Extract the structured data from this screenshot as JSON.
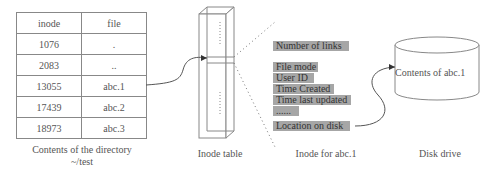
{
  "directory_table": {
    "headers": [
      "inode",
      "file"
    ],
    "rows": [
      [
        "1076",
        "."
      ],
      [
        "2083",
        ".."
      ],
      [
        "13055",
        "abc.1"
      ],
      [
        "17439",
        "abc.2"
      ],
      [
        "18973",
        "abc.3"
      ]
    ],
    "caption_line1": "Contents of the directory",
    "caption_line2": "~/test"
  },
  "inode_table": {
    "caption": "Inode table"
  },
  "inode_fields": {
    "caption": "Inode for abc.1",
    "items": [
      "Number of links",
      "File mode",
      "User ID",
      "Time Created",
      "Time last updated",
      "......",
      "Location on disk"
    ]
  },
  "disk": {
    "label": "Contents of abc.1",
    "caption": "Disk drive"
  },
  "colors": {
    "line": "#888888",
    "field_bg": "#a6a6a6",
    "text": "#555555"
  }
}
